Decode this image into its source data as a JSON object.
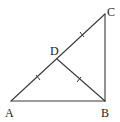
{
  "diagram": {
    "type": "geometry-triangle",
    "stroke_color": "#3a3a3a",
    "points": {
      "A": {
        "label": "A",
        "x": 11,
        "y": 101
      },
      "B": {
        "label": "B",
        "x": 105,
        "y": 101
      },
      "C": {
        "label": "C",
        "x": 105,
        "y": 14
      },
      "D": {
        "label": "D",
        "x": 57,
        "y": 59
      }
    },
    "segments": [
      "AB",
      "BC",
      "AC",
      "DB"
    ],
    "equal_marks": [
      "AD",
      "DC",
      "DB"
    ],
    "labels": {
      "A": "A",
      "B": "B",
      "C": "C",
      "D": "D"
    }
  }
}
